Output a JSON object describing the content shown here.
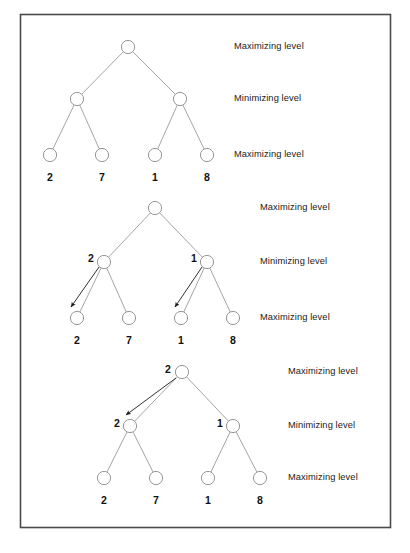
{
  "figure": {
    "border": {
      "x": 20,
      "y": 14,
      "width": 370,
      "height": 513,
      "color": "#4a4a4a"
    },
    "node": {
      "radius": 6.6,
      "stroke": "#8a8a8a",
      "fill": "#ffffff"
    },
    "edge": {
      "color": "#9a9a9a"
    },
    "arrow": {
      "color": "#1a1a1a"
    },
    "level_labels": [
      "Maximizing level",
      "Minimizing level",
      "Maximizing level"
    ],
    "leaf_values": [
      "2",
      "7",
      "1",
      "8"
    ],
    "trees": [
      {
        "name": "tree-top",
        "caption_x": 234,
        "root": {
          "x": 128,
          "y": 47
        },
        "inner": [
          {
            "x": 77,
            "y": 99
          },
          {
            "x": 180,
            "y": 99
          }
        ],
        "leaves": [
          {
            "x": 50,
            "y": 155
          },
          {
            "x": 102,
            "y": 155
          },
          {
            "x": 155,
            "y": 155
          },
          {
            "x": 207,
            "y": 155
          }
        ],
        "leaf_label_y": 178,
        "label_y": [
          47,
          99,
          155
        ],
        "annotations": [],
        "arrows": []
      },
      {
        "name": "tree-middle",
        "caption_x": 260,
        "root": {
          "x": 155,
          "y": 208
        },
        "inner": [
          {
            "x": 104,
            "y": 262
          },
          {
            "x": 207,
            "y": 262
          }
        ],
        "leaves": [
          {
            "x": 77,
            "y": 318
          },
          {
            "x": 129,
            "y": 318
          },
          {
            "x": 181,
            "y": 318
          },
          {
            "x": 233,
            "y": 318
          }
        ],
        "leaf_label_y": 341,
        "label_y": [
          208,
          262,
          318
        ],
        "annotations": [
          {
            "text": "2",
            "x": 91,
            "y": 258
          },
          {
            "text": "1",
            "x": 194,
            "y": 258
          }
        ],
        "arrows": [
          {
            "x1": 99,
            "y1": 267,
            "x2": 71,
            "y2": 307
          },
          {
            "x1": 202,
            "y1": 267,
            "x2": 175,
            "y2": 307
          }
        ]
      },
      {
        "name": "tree-bottom",
        "caption_x": 288,
        "root": {
          "x": 182,
          "y": 372
        },
        "inner": [
          {
            "x": 130,
            "y": 426
          },
          {
            "x": 233,
            "y": 426
          }
        ],
        "leaves": [
          {
            "x": 104,
            "y": 478
          },
          {
            "x": 156,
            "y": 478
          },
          {
            "x": 208,
            "y": 478
          },
          {
            "x": 260,
            "y": 478
          }
        ],
        "leaf_label_y": 501,
        "label_y": [
          372,
          426,
          478
        ],
        "annotations": [
          {
            "text": "2",
            "x": 168,
            "y": 369
          },
          {
            "text": "2",
            "x": 117,
            "y": 423
          },
          {
            "text": "1",
            "x": 220,
            "y": 423
          }
        ],
        "arrows": [
          {
            "x1": 176,
            "y1": 378,
            "x2": 126,
            "y2": 415
          }
        ]
      }
    ]
  }
}
